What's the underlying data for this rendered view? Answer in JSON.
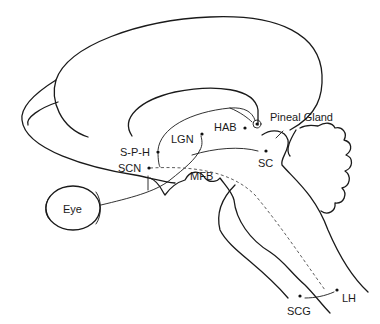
{
  "diagram": {
    "type": "sagittal brain pathway schematic",
    "labels": {
      "pineal_gland": "Pineal Gland",
      "hab": "HAB",
      "lgn": "LGN",
      "sph": "S-P-H",
      "scn": "SCN",
      "sc": "SC",
      "mfb": "MFB",
      "eye": "Eye",
      "lh": "LH",
      "scg": "SCG"
    },
    "colors": {
      "line": "#1a1a1a",
      "background": "#ffffff"
    }
  }
}
